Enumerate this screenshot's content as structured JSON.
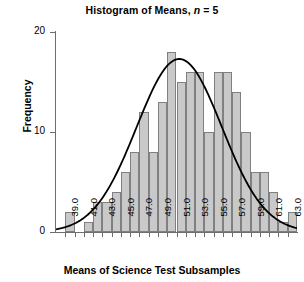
{
  "chart_data": {
    "type": "bar",
    "title": "Histogram of Means, n = 5",
    "title_prefix": "Histogram of Means, ",
    "title_italic": "n",
    "title_suffix": " = 5",
    "xlabel": "Means of Science Test Subsamples",
    "ylabel": "Frequency",
    "grid": false,
    "legend": "none",
    "xlim": [
      38.0,
      64.0
    ],
    "ylim": [
      0,
      20
    ],
    "bin_width": 1.0,
    "x_tick_labels": [
      "39.0",
      "41.0",
      "43.0",
      "45.0",
      "47.0",
      "49.0",
      "51.0",
      "53.0",
      "55.0",
      "57.0",
      "59.0",
      "61.0",
      "63.0"
    ],
    "x_tick_values": [
      39.0,
      41.0,
      43.0,
      45.0,
      47.0,
      49.0,
      51.0,
      53.0,
      55.0,
      57.0,
      59.0,
      61.0,
      63.0
    ],
    "x_minor_tick_values": [
      40.0,
      42.0,
      44.0,
      46.0,
      48.0,
      50.0,
      52.0,
      54.0,
      56.0,
      58.0,
      60.0,
      62.0
    ],
    "y_tick_labels": [
      "0",
      "10",
      "20"
    ],
    "y_tick_values": [
      0,
      10,
      20
    ],
    "bin_centers": [
      38.5,
      39.5,
      40.5,
      41.5,
      42.5,
      43.5,
      44.5,
      45.5,
      46.5,
      47.5,
      48.5,
      49.5,
      50.5,
      51.5,
      52.5,
      53.5,
      54.5,
      55.5,
      56.5,
      57.5,
      58.5,
      59.5,
      60.5,
      61.5,
      62.5,
      63.5
    ],
    "categories": [
      "38-39",
      "39-40",
      "40-41",
      "41-42",
      "42-43",
      "43-44",
      "44-45",
      "45-46",
      "46-47",
      "47-48",
      "48-49",
      "49-50",
      "50-51",
      "51-52",
      "52-53",
      "53-54",
      "54-55",
      "55-56",
      "56-57",
      "57-58",
      "58-59",
      "59-60",
      "60-61",
      "61-62",
      "62-63",
      "63-64"
    ],
    "values": [
      0,
      2,
      0,
      1,
      3,
      3,
      4,
      6,
      8,
      12,
      8,
      13,
      18,
      15,
      16,
      16,
      10,
      16,
      16,
      14,
      10,
      6,
      6,
      4,
      1,
      2
    ],
    "bar_fill_color": "#c9c9c9",
    "bar_border_color": "#808080",
    "overlay_curve": {
      "type": "normal_density",
      "mean": 51.3,
      "sd": 4.6,
      "peak_value": 17.3,
      "color": "#000000",
      "line_width": 1.8
    }
  }
}
